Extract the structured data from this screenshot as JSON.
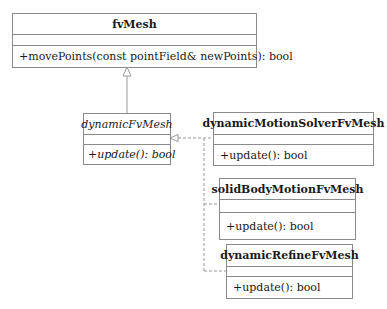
{
  "diagram": {
    "type": "uml-class-diagram",
    "classes": [
      {
        "name": "fvMesh",
        "abstract": false,
        "attributes": [],
        "operations": [
          "+movePoints(const pointField& newPoints): bool"
        ]
      },
      {
        "name": "dynamicFvMesh",
        "abstract": true,
        "attributes": [],
        "operations": [
          "+update(): bool"
        ]
      },
      {
        "name": "dynamicMotionSolverFvMesh",
        "abstract": false,
        "attributes": [],
        "operations": [
          "+update(): bool"
        ]
      },
      {
        "name": "solidBodyMotionFvMesh",
        "abstract": false,
        "attributes": [],
        "operations": [
          "+update(): bool"
        ]
      },
      {
        "name": "dynamicRefineFvMesh",
        "abstract": false,
        "attributes": [],
        "operations": [
          "+update(): bool"
        ]
      }
    ],
    "relations": [
      {
        "from": "dynamicFvMesh",
        "to": "fvMesh",
        "type": "generalization",
        "style": "solid"
      },
      {
        "from": "dynamicMotionSolverFvMesh",
        "to": "dynamicFvMesh",
        "type": "generalization",
        "style": "dashed"
      },
      {
        "from": "solidBodyMotionFvMesh",
        "to": "dynamicFvMesh",
        "type": "generalization",
        "style": "dashed"
      },
      {
        "from": "dynamicRefineFvMesh",
        "to": "dynamicFvMesh",
        "type": "generalization",
        "style": "dashed"
      }
    ],
    "colors": {
      "border": "#8a8a8a",
      "text": "#1a1a1a",
      "background": "#ffffff"
    }
  }
}
